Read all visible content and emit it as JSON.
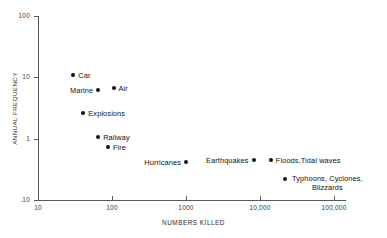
{
  "chart_data": {
    "type": "scatter",
    "title": "",
    "xlabel": "NUMBERS KILLED",
    "ylabel": "ANNUAL FREQUENCY",
    "xscale": "log",
    "yscale": "log",
    "xlim": [
      10,
      100000
    ],
    "ylim": [
      0.1,
      100
    ],
    "grid": false,
    "legend": "none",
    "xticks": [
      {
        "value": 10,
        "label": "10"
      },
      {
        "value": 100,
        "label": "100"
      },
      {
        "value": 1000,
        "label": "1000"
      },
      {
        "value": 10000,
        "label": "10,000"
      },
      {
        "value": 100000,
        "label": "100,000"
      }
    ],
    "yticks": [
      {
        "value": 100,
        "label": "100"
      },
      {
        "value": 10,
        "label": "10"
      },
      {
        "value": 1,
        "label": "1"
      },
      {
        "value": 0.1,
        "label": ".10"
      }
    ],
    "points": [
      {
        "name": "Car",
        "x": 30,
        "y": 11.0,
        "label": "Car",
        "label_side": "right"
      },
      {
        "name": "Marine",
        "x": 65,
        "y": 6.3,
        "label": "Marine",
        "label_side": "left"
      },
      {
        "name": "Air",
        "x": 105,
        "y": 6.6,
        "label": "Air",
        "label_side": "right"
      },
      {
        "name": "Explosions",
        "x": 41,
        "y": 2.6,
        "label": "Explosions",
        "label_side": "right"
      },
      {
        "name": "Railway",
        "x": 65,
        "y": 1.05,
        "label": "Railway",
        "label_side": "right"
      },
      {
        "name": "Fire",
        "x": 88,
        "y": 0.72,
        "label": "Fire",
        "label_side": "right"
      },
      {
        "name": "Hurricanes",
        "x": 1000,
        "y": 0.42,
        "label": "Hurricanes",
        "label_side": "left"
      },
      {
        "name": "Earthquakes",
        "x": 8200,
        "y": 0.45,
        "label": "Earthquakes",
        "label_side": "left"
      },
      {
        "name": "Floods, Tidal waves",
        "x": 14000,
        "y": 0.45,
        "label": "Floods,Tidal waves",
        "label_side": "right"
      },
      {
        "name": "Typhoons, Cyclones, Blizzards",
        "x": 22000,
        "y": 0.22,
        "label": "Typhoons, Cyclones,\nBlizzards",
        "label_side": "right"
      }
    ]
  }
}
